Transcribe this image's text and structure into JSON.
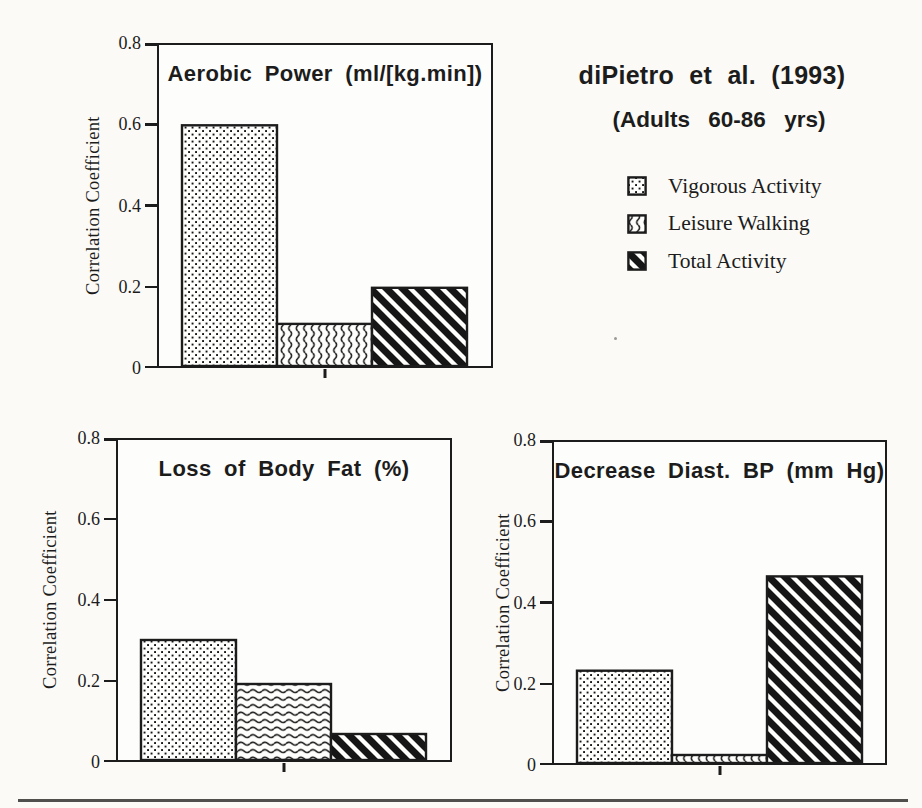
{
  "page": {
    "background_color": "#fbfaf6",
    "ink_color": "#1c1c1c",
    "footer_rule_color": "#4f4f4d"
  },
  "header": {
    "study_label": "diPietro et al. (1993)",
    "population_label": "(Adults 60-86 yrs)"
  },
  "legend": {
    "items": [
      {
        "label": "Vigorous Activity",
        "pattern": "dots"
      },
      {
        "label": "Leisure Walking",
        "pattern": "squiggle"
      },
      {
        "label": "Total Activity",
        "pattern": "diagonal"
      }
    ]
  },
  "chart_data": [
    {
      "type": "bar",
      "title": "Aerobic Power (ml/[kg.min])",
      "xlabel": "",
      "ylabel": "Correlation Coefficient",
      "ylim": [
        0,
        0.8
      ],
      "yticks": [
        0,
        0.2,
        0.4,
        0.6,
        0.8
      ],
      "grid": false,
      "categories": [
        "Vigorous Activity",
        "Leisure Walking",
        "Total Activity"
      ],
      "values": [
        0.6,
        0.105,
        0.195
      ],
      "patterns": [
        "dots",
        "squiggle-v",
        "diagonal"
      ],
      "legend_position": "outside-right"
    },
    {
      "type": "bar",
      "title": "Loss of Body Fat (%)",
      "xlabel": "",
      "ylabel": "Correlation Coefficient",
      "ylim": [
        0,
        0.8
      ],
      "yticks": [
        0,
        0.2,
        0.4,
        0.6,
        0.8
      ],
      "grid": false,
      "categories": [
        "Vigorous Activity",
        "Leisure Walking",
        "Total Activity"
      ],
      "values": [
        0.3,
        0.19,
        0.065
      ],
      "patterns": [
        "dots",
        "squiggle-h",
        "diagonal"
      ]
    },
    {
      "type": "bar",
      "title": "Decrease Diast. BP (mm Hg)",
      "xlabel": "",
      "ylabel": "Correlation Coefficient",
      "ylim": [
        0,
        0.8
      ],
      "yticks": [
        0,
        0.2,
        0.4,
        0.6,
        0.8
      ],
      "grid": false,
      "categories": [
        "Vigorous Activity",
        "Leisure Walking",
        "Total Activity"
      ],
      "values": [
        0.23,
        0.02,
        0.465
      ],
      "patterns": [
        "dots",
        "squiggle-v",
        "diagonal"
      ]
    }
  ]
}
